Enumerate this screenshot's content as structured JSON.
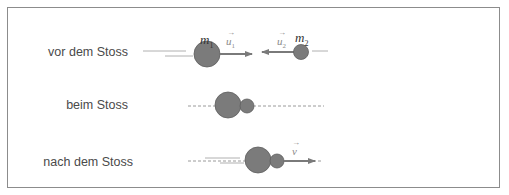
{
  "diagram": {
    "colors": {
      "ball": "#7b7b7b",
      "ball_stroke": "#5e5e5e",
      "arrow": "#7a7a7a",
      "line": "#9a9a9a",
      "border": "#8c8c8c",
      "text": "#4a4a4a"
    },
    "rows": [
      {
        "label": "vor dem Stoss",
        "mass1": "m",
        "mass1_sub": "1",
        "mass2": "m",
        "mass2_sub": "2",
        "vec1": "u",
        "vec1_sub": "1",
        "vec2": "u",
        "vec2_sub": "2"
      },
      {
        "label": "beim Stoss"
      },
      {
        "label": "nach dem Stoss",
        "vec": "v"
      }
    ]
  }
}
